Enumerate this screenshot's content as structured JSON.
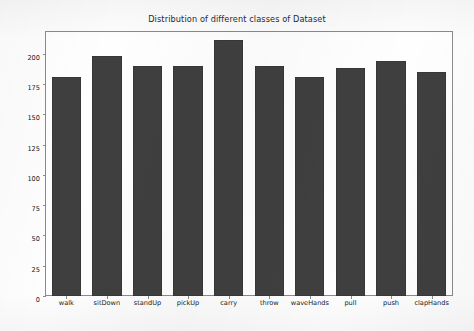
{
  "chart_data": {
    "type": "bar",
    "title": "Distribution of different classes of Dataset",
    "xlabel": "",
    "ylabel": "",
    "categories": [
      "walk",
      "sitDown",
      "standUp",
      "pickUp",
      "carry",
      "throw",
      "waveHands",
      "pull",
      "push",
      "clapHands"
    ],
    "values": [
      181,
      198,
      190,
      190,
      211,
      190,
      181,
      188,
      194,
      185
    ],
    "ylim": [
      0,
      218
    ],
    "yticks": [
      0,
      25,
      50,
      75,
      100,
      125,
      150,
      175,
      200
    ],
    "ytick_labels": [
      "0",
      "25",
      "50",
      "75",
      "100",
      "125",
      "150",
      "175",
      "200"
    ],
    "grid": false,
    "legend": null,
    "bar_color": "#3f3f3f",
    "background_color": "#fefefe",
    "axis_color": "#8a8a8a",
    "text_color": "#222222"
  }
}
